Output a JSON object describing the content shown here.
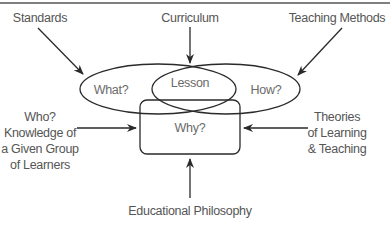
{
  "diagram": {
    "top_labels": {
      "standards": "Standards",
      "curriculum": "Curriculum",
      "teaching_methods": "Teaching Methods"
    },
    "shapes": {
      "what": "What?",
      "lesson": "Lesson",
      "how": "How?",
      "why": "Why?"
    },
    "side_labels": {
      "who": [
        "Who?",
        "Knowledge of",
        "a Given Group",
        "of Learners"
      ],
      "theories": [
        "Theories",
        "of Learning",
        "& Teaching"
      ]
    },
    "bottom_label": "Educational Philosophy",
    "colors": {
      "stroke": "#2a2a2a",
      "text": "#555555",
      "border": "#555555",
      "background": "#ffffff"
    }
  }
}
